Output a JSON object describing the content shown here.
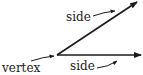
{
  "diagram": {
    "type": "angle",
    "labels": {
      "side_top": "side",
      "side_bottom": "side",
      "vertex": "vertex"
    },
    "colors": {
      "stroke": "#1a1a1a",
      "background": "#ffffff"
    }
  }
}
